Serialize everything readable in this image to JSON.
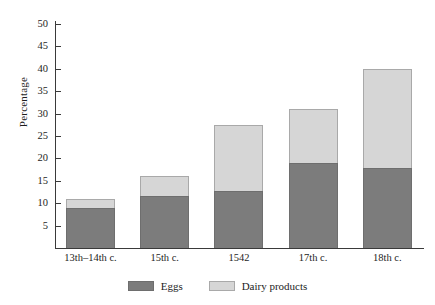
{
  "chart_data": {
    "type": "bar",
    "subtype": "stacked",
    "title": "",
    "xlabel": "",
    "ylabel": "Percentage",
    "ylim": [
      0,
      50
    ],
    "ytick_step": 5,
    "yticks": [
      50,
      45,
      40,
      35,
      30,
      25,
      20,
      15,
      10,
      5
    ],
    "grid": false,
    "legend_position": "bottom-center",
    "categories": [
      "13th–14th c.",
      "15th c.",
      "1542",
      "17th c.",
      "18th c."
    ],
    "series": [
      {
        "name": "Eggs",
        "color": "#7c7c7c",
        "values": [
          9,
          11.5,
          12.8,
          19,
          17.8
        ]
      },
      {
        "name": "Dairy products",
        "color": "#d6d6d6",
        "values": [
          2,
          4.5,
          14.7,
          12,
          22.2
        ]
      }
    ],
    "totals": [
      11,
      16,
      27.5,
      31,
      40
    ]
  },
  "axes": {
    "y_title": "Percentage",
    "y_tick_labels": [
      "50",
      "45",
      "40",
      "35",
      "30",
      "25",
      "20",
      "15",
      "10",
      "5"
    ]
  },
  "legend": {
    "items": [
      {
        "label": "Eggs",
        "swatch": "dark-gray-swatch"
      },
      {
        "label": "Dairy products",
        "swatch": "light-gray-swatch"
      }
    ]
  },
  "colors": {
    "eggs": "#7c7c7c",
    "dairy": "#d6d6d6",
    "axis": "#3a3a3a",
    "text": "#1d1d1d",
    "background": "#ffffff"
  }
}
